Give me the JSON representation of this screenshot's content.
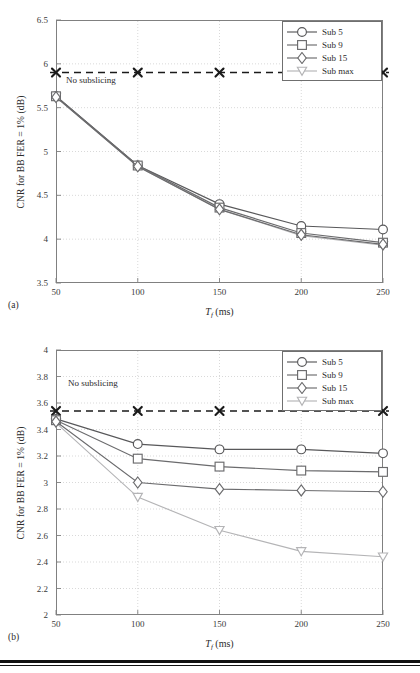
{
  "figure": {
    "panels": [
      {
        "id": "a",
        "caption": "(a)",
        "annotation": "No subslicing",
        "axis": {
          "ylabel": "CNR for BB FER = 1% (dB)",
          "xlabel_main": "T",
          "xlabel_sub": "f",
          "xlabel_unit": "(ms)",
          "yticks": [
            "3.5",
            "4",
            "4.5",
            "5",
            "5.5",
            "6",
            "6.5"
          ],
          "xticks": [
            "50",
            "100",
            "150",
            "200",
            "250"
          ]
        },
        "legend": [
          "Sub 5",
          "Sub 9",
          "Sub 15",
          "Sub max"
        ]
      },
      {
        "id": "b",
        "caption": "(b)",
        "annotation": "No subslicing",
        "axis": {
          "ylabel": "CNR for BB FER = 1% (dB)",
          "xlabel_main": "T",
          "xlabel_sub": "f",
          "xlabel_unit": "(ms)",
          "yticks": [
            "2",
            "2.2",
            "2.4",
            "2.6",
            "2.8",
            "3",
            "3.2",
            "3.4",
            "3.6",
            "3.8",
            "4"
          ],
          "xticks": [
            "50",
            "100",
            "150",
            "200",
            "250"
          ]
        },
        "legend": [
          "Sub 5",
          "Sub 9",
          "Sub 15",
          "Sub max"
        ]
      }
    ]
  },
  "colors": {
    "line_dark": "#58585a",
    "line_mid": "#6b6b6d",
    "line_light": "#b4b4b6",
    "baseline": "#1a1a1a",
    "grid": "#c8c8c8",
    "frame": "#808080",
    "text": "#2b2b2b"
  },
  "chart_data": [
    {
      "type": "line",
      "id": "a",
      "title": "",
      "xlabel": "T_f (ms)",
      "ylabel": "CNR for BB FER = 1% (dB)",
      "x": [
        50,
        100,
        150,
        200,
        250
      ],
      "xlim": [
        50,
        250
      ],
      "ylim": [
        3.5,
        6.5
      ],
      "ytick_values": [
        3.5,
        4,
        4.5,
        5,
        5.5,
        6,
        6.5
      ],
      "xtick_values": [
        50,
        100,
        150,
        200,
        250
      ],
      "grid": true,
      "legend_position": "upper-right",
      "series": [
        {
          "name": "Sub 5",
          "marker": "circle",
          "color": "#58585a",
          "values": [
            5.63,
            4.84,
            4.4,
            4.15,
            4.11
          ]
        },
        {
          "name": "Sub 9",
          "marker": "square",
          "color": "#6b6b6d",
          "values": [
            5.63,
            4.84,
            4.36,
            4.07,
            3.96
          ]
        },
        {
          "name": "Sub 15",
          "marker": "diamond",
          "color": "#6b6b6d",
          "values": [
            5.62,
            4.83,
            4.34,
            4.05,
            3.94
          ]
        },
        {
          "name": "Sub max",
          "marker": "triangle-down",
          "color": "#b4b4b6",
          "values": [
            5.62,
            4.83,
            4.34,
            4.04,
            3.93
          ]
        }
      ],
      "annotations": [
        {
          "text": "No subslicing",
          "type": "horizontal-dashed-line",
          "y": 5.9,
          "marker": "x",
          "marker_x": [
            50,
            100,
            150,
            250
          ],
          "color": "#1a1a1a"
        }
      ]
    },
    {
      "type": "line",
      "id": "b",
      "title": "",
      "xlabel": "T_f (ms)",
      "ylabel": "CNR for BB FER = 1% (dB)",
      "x": [
        50,
        100,
        150,
        200,
        250
      ],
      "xlim": [
        50,
        250
      ],
      "ylim": [
        2,
        4
      ],
      "ytick_values": [
        2,
        2.2,
        2.4,
        2.6,
        2.8,
        3,
        3.2,
        3.4,
        3.6,
        3.8,
        4
      ],
      "xtick_values": [
        50,
        100,
        150,
        200,
        250
      ],
      "grid": true,
      "legend_position": "upper-right",
      "series": [
        {
          "name": "Sub 5",
          "marker": "circle",
          "color": "#58585a",
          "values": [
            3.48,
            3.29,
            3.25,
            3.25,
            3.22
          ]
        },
        {
          "name": "Sub 9",
          "marker": "square",
          "color": "#6b6b6d",
          "values": [
            3.47,
            3.18,
            3.12,
            3.09,
            3.08
          ]
        },
        {
          "name": "Sub 15",
          "marker": "diamond",
          "color": "#6b6b6d",
          "values": [
            3.46,
            3.0,
            2.95,
            2.94,
            2.93
          ]
        },
        {
          "name": "Sub max",
          "marker": "triangle-down",
          "color": "#b4b4b6",
          "values": [
            3.45,
            2.89,
            2.64,
            2.48,
            2.44
          ]
        }
      ],
      "annotations": [
        {
          "text": "No subslicing",
          "type": "horizontal-dashed-line",
          "y": 3.54,
          "marker": "x",
          "marker_x": [
            50,
            100,
            150,
            250
          ],
          "color": "#1a1a1a"
        }
      ]
    }
  ]
}
